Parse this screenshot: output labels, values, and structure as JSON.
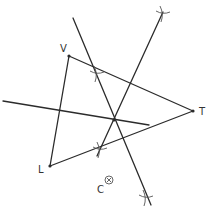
{
  "diagram": {
    "colors": {
      "line": "#2b2b2b",
      "arc": "#555555",
      "label": "#333333",
      "background": "#ffffff"
    },
    "vertices": [
      {
        "id": "V",
        "label": "V",
        "x": 69,
        "y": 56,
        "label_x": 60,
        "label_y": 52
      },
      {
        "id": "T",
        "label": "T",
        "x": 193,
        "y": 111,
        "label_x": 199,
        "label_y": 115
      },
      {
        "id": "L",
        "label": "L",
        "x": 50,
        "y": 166,
        "label_x": 38,
        "label_y": 173
      }
    ],
    "triangle_edges": [
      {
        "from": "V",
        "to": "T"
      },
      {
        "from": "T",
        "to": "L"
      },
      {
        "from": "L",
        "to": "V"
      }
    ],
    "bisectors": [
      {
        "name": "bisector-vt",
        "x1": 73,
        "y1": 18,
        "x2": 151,
        "y2": 205
      },
      {
        "name": "bisector-lt",
        "x1": 163,
        "y1": 12,
        "x2": 97,
        "y2": 156
      },
      {
        "name": "bisector-lv",
        "x1": 3,
        "y1": 101,
        "x2": 149,
        "y2": 125
      }
    ],
    "arc_marks": [
      {
        "x": 97,
        "y": 74
      },
      {
        "x": 163,
        "y": 14
      },
      {
        "x": 100,
        "y": 150
      },
      {
        "x": 146,
        "y": 198
      }
    ],
    "intersection": {
      "x": 114,
      "y": 120
    },
    "point_c": {
      "label": "C",
      "x": 109,
      "y": 180,
      "label_x": 97,
      "label_y": 193,
      "symbol": "circled-x"
    }
  }
}
